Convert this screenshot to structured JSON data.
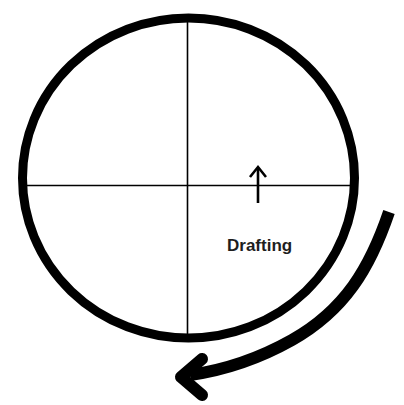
{
  "diagram": {
    "labels": {
      "main": "Drafting"
    },
    "colors": {
      "stroke": "#000000",
      "background": "#ffffff",
      "text": "#1e1e1e"
    },
    "elements": [
      {
        "type": "ellipse",
        "name": "outer-circle"
      },
      {
        "type": "line",
        "name": "vertical-axis"
      },
      {
        "type": "line",
        "name": "horizontal-axis"
      },
      {
        "type": "arrow",
        "name": "up-arrow",
        "direction": "up"
      },
      {
        "type": "text",
        "name": "drafting-label"
      },
      {
        "type": "curved-arrow",
        "name": "rotation-arrow",
        "direction": "clockwise"
      }
    ]
  }
}
